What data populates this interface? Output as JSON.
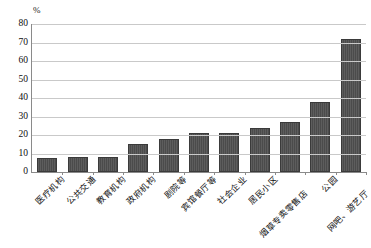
{
  "chart_data": {
    "type": "bar",
    "title": "",
    "subtitle": "",
    "xlabel": "",
    "ylabel": "",
    "unit_label": "%",
    "ylim": [
      0,
      80
    ],
    "ytick_values": [
      0,
      10,
      20,
      30,
      40,
      50,
      60,
      70,
      80
    ],
    "ytick_labels": [
      "0",
      "10",
      "20",
      "30",
      "40",
      "50",
      "60",
      "70",
      "80"
    ],
    "grid": true,
    "legend": false,
    "legend_position": "none",
    "bar_color": "#4b4b4b",
    "axis_color": "#8a8a8a",
    "grid_color": "#c9c9c9",
    "categories": [
      "医疗机构",
      "公共交通",
      "教育机构",
      "政府机构",
      "剧院等",
      "宾馆餐厅等",
      "社会企业",
      "居民小区",
      "烟草专卖零售店",
      "公园",
      "网吧、游艺厅"
    ],
    "values": [
      7.5,
      8,
      8,
      15,
      18,
      21,
      21,
      24,
      27,
      38,
      72
    ],
    "series": [
      {
        "name": "",
        "values": [
          7.5,
          8,
          8,
          15,
          18,
          21,
          21,
          24,
          27,
          38,
          72
        ]
      }
    ]
  }
}
